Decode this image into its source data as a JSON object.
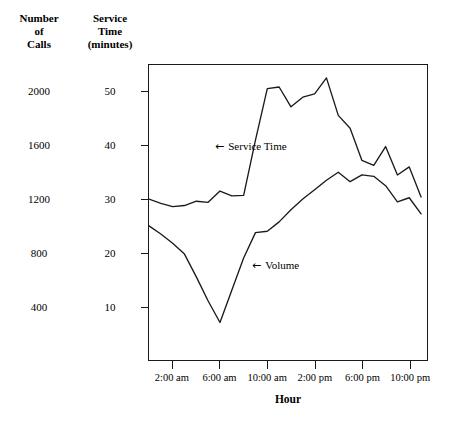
{
  "axes": {
    "left_primary_title": [
      "Number",
      "of",
      "Calls"
    ],
    "left_secondary_title": [
      "Service",
      "Time",
      "(minutes)"
    ],
    "xaxis_title": "Hour",
    "calls_ticks": [
      "2000",
      "1600",
      "1200",
      "800",
      "400"
    ],
    "minutes_ticks": [
      "50",
      "40",
      "30",
      "20",
      "10"
    ],
    "xtick_labels": [
      "2:00 am",
      "6:00 am",
      "10:00 am",
      "2:00 pm",
      "6:00 pm",
      "10:00 pm"
    ]
  },
  "annotations": {
    "service_arrow": "←",
    "service_text": "Service Time",
    "volume_arrow": "←",
    "volume_text": "Volume"
  },
  "style": {
    "line_color": "#1a1a1a",
    "frame_color": "#1a1a1a",
    "background": "#ffffff"
  },
  "chart_data": {
    "type": "line",
    "title": "",
    "xlabel": "Hour",
    "ylabel": "Number of Calls / Service Time (minutes)",
    "grid": false,
    "legend": "inline-arrow-annotations",
    "x_axis": {
      "label": "Hour",
      "tick_values": [
        2,
        6,
        10,
        14,
        18,
        22
      ],
      "tick_labels": [
        "2:00 am",
        "6:00 am",
        "10:00 am",
        "2:00 pm",
        "6:00 pm",
        "10:00 pm"
      ],
      "range": [
        0,
        23.5
      ]
    },
    "y_axis_primary": {
      "label": "Number of Calls",
      "tick_values": [
        400,
        800,
        1200,
        1600,
        2000
      ],
      "tick_labels": [
        "400",
        "800",
        "1200",
        "1600",
        "2000"
      ],
      "range": [
        0,
        2200
      ]
    },
    "y_axis_secondary": {
      "label": "Service Time (minutes)",
      "tick_values": [
        10,
        20,
        30,
        40,
        50
      ],
      "tick_labels": [
        "10",
        "20",
        "30",
        "40",
        "50"
      ],
      "range": [
        0,
        55
      ]
    },
    "x": [
      0,
      1,
      2,
      3,
      4,
      5,
      6,
      7,
      8,
      9,
      10,
      11,
      12,
      13,
      14,
      15,
      16,
      17,
      18,
      19,
      20,
      21,
      22,
      23
    ],
    "series": [
      {
        "name": "Service Time",
        "unit": "minutes",
        "axis": "secondary",
        "values": [
          30.0,
          29.2,
          28.6,
          28.8,
          29.6,
          29.4,
          31.5,
          30.6,
          30.7,
          41.0,
          50.6,
          50.9,
          47.2,
          49.0,
          49.6,
          52.6,
          45.6,
          43.2,
          37.2,
          36.3,
          39.8,
          34.5,
          36.0,
          30.4
        ]
      },
      {
        "name": "Volume",
        "unit": "calls",
        "axis": "primary",
        "values": [
          1000,
          940,
          870,
          790,
          620,
          440,
          280,
          520,
          760,
          950,
          960,
          1030,
          1120,
          1200,
          1270,
          1340,
          1400,
          1330,
          1380,
          1370,
          1300,
          1180,
          1210,
          1090
        ]
      }
    ]
  }
}
